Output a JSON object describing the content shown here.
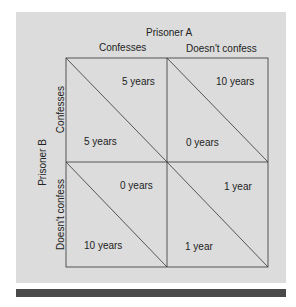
{
  "title_top": "Prisoner A",
  "title_side": "Prisoner B",
  "columns": [
    "Confesses",
    "Doesn't confess"
  ],
  "rows": [
    "Confesses",
    "Doesn't confess"
  ],
  "cells": [
    [
      {
        "a": "5 years",
        "b": "5 years"
      },
      {
        "a": "10 years",
        "b": "0 years"
      }
    ],
    [
      {
        "a": "0 years",
        "b": "10 years"
      },
      {
        "a": "1 year",
        "b": "1 year"
      }
    ]
  ],
  "colors": {
    "panel": "#dcdcdc",
    "bar": "#4a4a4a",
    "line": "#333333"
  }
}
